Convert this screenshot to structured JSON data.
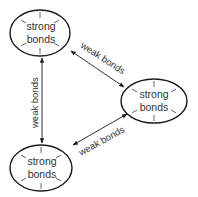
{
  "diagram": {
    "colors": {
      "stroke": "#1a1a1a",
      "text": "#333333",
      "ray": "#555555",
      "background": "#ffffff"
    },
    "nodes": [
      {
        "id": "top-left",
        "line1": "strong",
        "line2": "bonds"
      },
      {
        "id": "right",
        "line1": "strong",
        "line2": "bonds"
      },
      {
        "id": "bottom-left",
        "line1": "strong",
        "line2": "bonds"
      }
    ],
    "edges": [
      {
        "from": "top-left",
        "to": "right",
        "label": "weak bonds",
        "arrows": "both"
      },
      {
        "from": "top-left",
        "to": "bottom-left",
        "label": "weak bonds",
        "arrows": "both"
      },
      {
        "from": "bottom-left",
        "to": "right",
        "label": "weak bonds",
        "arrows": "both"
      }
    ]
  }
}
